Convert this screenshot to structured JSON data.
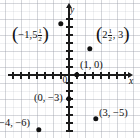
{
  "figure": {
    "type": "coordinate-plane-scatter",
    "width": 140,
    "height": 138,
    "origin_label": "0",
    "x_axis_name": "x",
    "y_axis_name": "y",
    "grid": "light-gray graph paper",
    "point_color": "#101010",
    "axis_color": "#1b1b1b",
    "grid_color": "#969baa",
    "unit_pixels": 8,
    "origin_px": {
      "x": 69,
      "y": 75
    }
  },
  "chart_data": {
    "type": "scatter",
    "title": "",
    "xlabel": "x",
    "ylabel": "y",
    "grid": true,
    "legend": "none",
    "xlim": [
      -7.6,
      7.6
    ],
    "ylim": [
      -7.9,
      8.6
    ],
    "points": [
      {
        "label": "(-1, 5 1/2)",
        "x": -1,
        "y": 5.5,
        "label_parts": {
          "open": "(",
          "first": "−1,",
          "whole": "5",
          "numerator": "1",
          "denominator": "2",
          "close": ")"
        },
        "label_px": {
          "x": 12,
          "y": 28
        },
        "point_px": {
          "x": 61,
          "y": 24
        },
        "has_fraction": true
      },
      {
        "label": "(2 1/2, 3)",
        "x": 2.5,
        "y": 3,
        "label_parts": {
          "open": "(",
          "whole": "2",
          "numerator": "1",
          "denominator": "2",
          "second": ", 3",
          "close": ")"
        },
        "label_px": {
          "x": 96,
          "y": 28
        },
        "point_px": {
          "x": 90,
          "y": 49
        },
        "has_fraction": true
      },
      {
        "label": "(1, 0)",
        "x": 1,
        "y": 0,
        "label_px": {
          "x": 80,
          "y": 60
        },
        "point_px": {
          "x": 77,
          "y": 75
        },
        "has_fraction": false
      },
      {
        "label": "(0, −3)",
        "x": 0,
        "y": -3,
        "label_px": {
          "x": 34,
          "y": 93
        },
        "point_px": {
          "x": 69,
          "y": 99
        },
        "has_fraction": false
      },
      {
        "label": "(3, −5)",
        "x": 3,
        "y": -5,
        "label_px": {
          "x": 99,
          "y": 108
        },
        "point_px": {
          "x": 96,
          "y": 119
        },
        "has_fraction": false
      },
      {
        "label": "−4, −6)",
        "x": -4,
        "y": -6,
        "label_px": {
          "x": -1,
          "y": 118
        },
        "point_px": {
          "x": 39,
          "y": 130
        },
        "has_fraction": false,
        "clipped_left": true
      }
    ],
    "x_ticks": [
      -7,
      -6,
      -5,
      -4,
      -3,
      -2,
      -1,
      1,
      2,
      3,
      4,
      5,
      6,
      7
    ],
    "y_ticks": [
      -7,
      -6,
      -5,
      -4,
      -3,
      -2,
      -1,
      1,
      2,
      3,
      4,
      5,
      6,
      7
    ],
    "tick_labels_shown": false
  }
}
